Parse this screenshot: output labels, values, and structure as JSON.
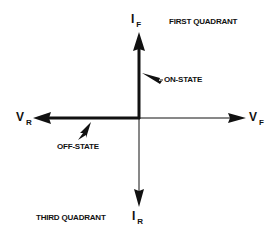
{
  "diagram": {
    "type": "quadrant-iv-characteristic",
    "labels": {
      "first_quadrant": "FIRST QUADRANT",
      "third_quadrant": "THIRD QUADRANT",
      "on_state": "ON-STATE",
      "off_state": "OFF-STATE"
    },
    "axes": {
      "forward_current": {
        "main": "I",
        "sub": "F"
      },
      "reverse_current": {
        "main": "I",
        "sub": "R"
      },
      "forward_voltage": {
        "main": "V",
        "sub": "F"
      },
      "reverse_voltage": {
        "main": "V",
        "sub": "R"
      }
    },
    "colors": {
      "line": "#111111",
      "background": "#ffffff"
    }
  }
}
